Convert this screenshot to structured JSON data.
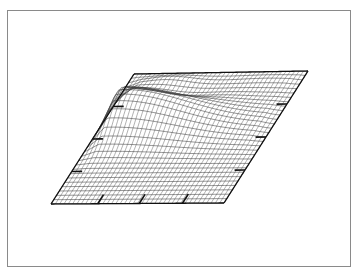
{
  "chart_data": {
    "type": "surface-wireframe",
    "title": "",
    "xlabel": "",
    "ylabel": "",
    "zlabel": "",
    "base_corners": {
      "front_left": [
        51,
        204
      ],
      "front_right": [
        224,
        203
      ],
      "back_right": [
        308,
        71
      ],
      "back_left": [
        134,
        74
      ]
    },
    "grid": {
      "u_lines": 40,
      "v_lines": 30
    },
    "features": [
      {
        "name": "main-ridge",
        "u_center": 0.12,
        "v_center": 0.62,
        "u_width": 0.55,
        "v_width": 0.13,
        "height": 32,
        "u_decay_right": 0.45
      },
      {
        "name": "rear-trough",
        "u_center": 0.35,
        "v_center": 0.8,
        "u_width": 0.3,
        "v_width": 0.06,
        "height": -6
      },
      {
        "name": "rear-bump",
        "u_center": 0.25,
        "v_center": 0.95,
        "u_width": 0.25,
        "v_width": 0.08,
        "height": 6
      },
      {
        "name": "rear-right-bump",
        "u_center": 0.8,
        "v_center": 0.97,
        "u_width": 0.3,
        "v_width": 0.06,
        "height": 3
      }
    ],
    "ticks": {
      "front_edge_u": [
        0.27,
        0.51,
        0.76
      ],
      "left_edge_v": [
        0.25,
        0.5,
        0.75
      ],
      "right_edge_v": [
        0.25,
        0.5,
        0.75
      ]
    },
    "colors": {
      "mesh": "#3a3a3a",
      "edge": "#111111",
      "frame": "#8a8a8a"
    }
  }
}
